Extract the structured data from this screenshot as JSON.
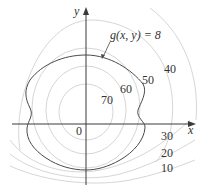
{
  "figure": {
    "axes": {
      "x_label": "x",
      "y_label": "y",
      "origin_label": "0"
    },
    "constraint": {
      "label": "g(x, y) = 8",
      "color": "#4a4a4a"
    },
    "contours": {
      "color": "#d6d6d6",
      "levels": [
        {
          "value": "70",
          "label": "70"
        },
        {
          "value": "60",
          "label": "60"
        },
        {
          "value": "50",
          "label": "50"
        },
        {
          "value": "40",
          "label": "40"
        },
        {
          "value": "30",
          "label": "30"
        },
        {
          "value": "20",
          "label": "20"
        },
        {
          "value": "10",
          "label": "10"
        }
      ]
    }
  }
}
